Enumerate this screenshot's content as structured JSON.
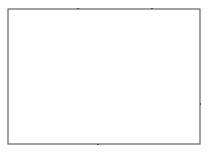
{
  "figure": {
    "width": 214,
    "height": 160
  },
  "colors": {
    "background": "#ffffff",
    "page": "#fefefe",
    "frame": "#555555",
    "grain_boundary": "#111111",
    "slip_line": "#8a8a8a",
    "arrow": "#111111"
  },
  "style": {
    "frame_width": 1.1,
    "boundary_width": 2.0,
    "slip_width": 0.7,
    "arrow_width": 1.1,
    "arrow_head_size": 3.6
  },
  "frame": {
    "x": 8,
    "y": 9,
    "width": 192,
    "height": 135
  },
  "grains": [
    {
      "id": "grain-left",
      "label": "Left grain",
      "slip_orientation_deg": 6,
      "slip_direction": "horizontal",
      "polygon": "8,9 78,9 103,40 75,75 98,118 98,144 8,144",
      "slip_lines": [
        {
          "x1": 8,
          "y1": 20,
          "x2": 84,
          "y2": 12
        },
        {
          "x1": 8,
          "y1": 34,
          "x2": 96,
          "y2": 25
        },
        {
          "x1": 8,
          "y1": 48,
          "x2": 95,
          "y2": 39
        },
        {
          "x1": 8,
          "y1": 62,
          "x2": 86,
          "y2": 54
        },
        {
          "x1": 8,
          "y1": 76,
          "x2": 76,
          "y2": 69
        },
        {
          "x1": 8,
          "y1": 90,
          "x2": 82,
          "y2": 82
        },
        {
          "x1": 8,
          "y1": 104,
          "x2": 90,
          "y2": 96
        },
        {
          "x1": 8,
          "y1": 118,
          "x2": 99,
          "y2": 109
        },
        {
          "x1": 8,
          "y1": 132,
          "x2": 102,
          "y2": 122
        }
      ],
      "arrows": [
        {
          "x": 46,
          "y": 17,
          "angle": 186,
          "length": 20
        },
        {
          "x": 52,
          "y": 31,
          "angle": 6,
          "length": 20
        },
        {
          "x": 48,
          "y": 45,
          "angle": 186,
          "length": 20
        },
        {
          "x": 52,
          "y": 58,
          "angle": 6,
          "length": 20
        },
        {
          "x": 46,
          "y": 72,
          "angle": 186,
          "length": 20
        },
        {
          "x": 47,
          "y": 87,
          "angle": 186,
          "length": 20
        },
        {
          "x": 60,
          "y": 101,
          "angle": 6,
          "length": 20
        },
        {
          "x": 69,
          "y": 114,
          "angle": 6,
          "length": 20
        },
        {
          "x": 69,
          "y": 136,
          "angle": 186,
          "length": 20
        }
      ]
    },
    {
      "id": "grain-top-wedge",
      "label": "Top wedge grain",
      "slip_orientation_deg": -12,
      "slip_direction": "shallow up-right",
      "polygon": "78,9 152,9 160,28 103,40",
      "slip_lines": [
        {
          "x1": 80,
          "y1": 16,
          "x2": 150,
          "y2": 9
        },
        {
          "x1": 85,
          "y1": 25,
          "x2": 157,
          "y2": 15
        },
        {
          "x1": 93,
          "y1": 33,
          "x2": 160,
          "y2": 22
        },
        {
          "x1": 100,
          "y1": 39,
          "x2": 160,
          "y2": 28
        }
      ],
      "arrows": [
        {
          "x": 97,
          "y": 13,
          "angle": 185,
          "length": 15
        },
        {
          "x": 127,
          "y": 18,
          "angle": 352,
          "length": 15
        },
        {
          "x": 134,
          "y": 27,
          "angle": 352,
          "length": 15
        },
        {
          "x": 138,
          "y": 34,
          "angle": 352,
          "length": 15
        }
      ]
    },
    {
      "id": "grain-center",
      "label": "Central grain",
      "slip_orientation_deg": 92,
      "slip_direction": "vertical",
      "polygon": "103,40 160,28 152,95 108,118 75,75",
      "slip_lines": [
        {
          "x1": 96,
          "y1": 46,
          "x2": 86,
          "y2": 86
        },
        {
          "x1": 107,
          "y1": 40,
          "x2": 97,
          "y2": 106
        },
        {
          "x1": 119,
          "y1": 38,
          "x2": 113,
          "y2": 117
        },
        {
          "x1": 131,
          "y1": 36,
          "x2": 130,
          "y2": 110
        },
        {
          "x1": 143,
          "y1": 33,
          "x2": 143,
          "y2": 102
        },
        {
          "x1": 154,
          "y1": 31,
          "x2": 151,
          "y2": 95
        }
      ],
      "arrows": [
        {
          "x": 81,
          "y": 80,
          "angle": 266,
          "length": 14
        },
        {
          "x": 93,
          "y": 77,
          "angle": 268,
          "length": 17
        },
        {
          "x": 105,
          "y": 74,
          "angle": 268,
          "length": 17
        },
        {
          "x": 118,
          "y": 73,
          "angle": 88,
          "length": 17
        },
        {
          "x": 131,
          "y": 70,
          "angle": 268,
          "length": 17
        },
        {
          "x": 143,
          "y": 68,
          "angle": 268,
          "length": 17
        },
        {
          "x": 152,
          "y": 66,
          "angle": 268,
          "length": 15
        }
      ]
    },
    {
      "id": "grain-right",
      "label": "Right grain",
      "slip_orientation_deg": 48,
      "slip_direction": "diagonal down-right",
      "polygon": "152,9 200,9 200,104 152,95 160,28",
      "slip_lines": [
        {
          "x1": 155,
          "y1": 22,
          "x2": 200,
          "y2": 68
        },
        {
          "x1": 160,
          "y1": 15,
          "x2": 200,
          "y2": 56
        },
        {
          "x1": 169,
          "y1": 9,
          "x2": 200,
          "y2": 42
        },
        {
          "x1": 181,
          "y1": 9,
          "x2": 200,
          "y2": 29
        },
        {
          "x1": 192,
          "y1": 9,
          "x2": 200,
          "y2": 17
        },
        {
          "x1": 153,
          "y1": 36,
          "x2": 200,
          "y2": 82
        },
        {
          "x1": 152,
          "y1": 50,
          "x2": 198,
          "y2": 95
        },
        {
          "x1": 152,
          "y1": 64,
          "x2": 190,
          "y2": 101
        },
        {
          "x1": 152,
          "y1": 78,
          "x2": 175,
          "y2": 101
        }
      ],
      "arrows": [
        {
          "x": 183,
          "y": 20,
          "angle": 45,
          "length": 12
        },
        {
          "x": 165,
          "y": 31,
          "angle": 45,
          "length": 12
        },
        {
          "x": 186,
          "y": 42,
          "angle": 45,
          "length": 12
        },
        {
          "x": 170,
          "y": 52,
          "angle": 45,
          "length": 12
        },
        {
          "x": 190,
          "y": 62,
          "angle": 45,
          "length": 12
        },
        {
          "x": 163,
          "y": 60,
          "angle": 45,
          "length": 12
        },
        {
          "x": 176,
          "y": 72,
          "angle": 45,
          "length": 12
        },
        {
          "x": 159,
          "y": 82,
          "angle": 45,
          "length": 12
        },
        {
          "x": 188,
          "y": 84,
          "angle": 45,
          "length": 12
        }
      ]
    },
    {
      "id": "grain-bottom-right",
      "label": "Bottom-right grain",
      "slip_orientation_deg": -9,
      "slip_direction": "shallow up-right",
      "polygon": "108,118 152,95 200,104 200,144 98,144",
      "slip_lines": [
        {
          "x1": 114,
          "y1": 115,
          "x2": 200,
          "y2": 107
        },
        {
          "x1": 108,
          "y1": 121,
          "x2": 200,
          "y2": 113
        },
        {
          "x1": 104,
          "y1": 128,
          "x2": 200,
          "y2": 119
        },
        {
          "x1": 101,
          "y1": 135,
          "x2": 200,
          "y2": 126
        },
        {
          "x1": 99,
          "y1": 141,
          "x2": 200,
          "y2": 133
        },
        {
          "x1": 120,
          "y1": 110,
          "x2": 200,
          "y2": 102
        }
      ],
      "arrows": [
        {
          "x": 126,
          "y": 113,
          "angle": 353,
          "length": 15
        },
        {
          "x": 126,
          "y": 120,
          "angle": 353,
          "length": 15
        },
        {
          "x": 135,
          "y": 126,
          "angle": 353,
          "length": 15
        },
        {
          "x": 142,
          "y": 133,
          "angle": 353,
          "length": 15
        },
        {
          "x": 158,
          "y": 139,
          "angle": 353,
          "length": 15
        },
        {
          "x": 170,
          "y": 110,
          "angle": 186,
          "length": 18
        },
        {
          "x": 180,
          "y": 124,
          "angle": 6,
          "length": 18
        }
      ]
    }
  ],
  "boundaries": [
    {
      "id": "boundary-left-top",
      "path": "M 78,9 L 103,40"
    },
    {
      "id": "boundary-left-center",
      "path": "M 103,40 L 75,75 L 108,118"
    },
    {
      "id": "boundary-top-right",
      "path": "M 152,9 L 160,28"
    },
    {
      "id": "boundary-center-top",
      "path": "M 103,40 L 160,28"
    },
    {
      "id": "boundary-center-right",
      "path": "M 160,28 L 152,95"
    },
    {
      "id": "boundary-center-bot",
      "path": "M 152,95 L 108,118"
    },
    {
      "id": "boundary-right-bot",
      "path": "M 152,95 L 200,104"
    },
    {
      "id": "boundary-bot-left",
      "path": "M 108,118 L 98,144"
    }
  ]
}
